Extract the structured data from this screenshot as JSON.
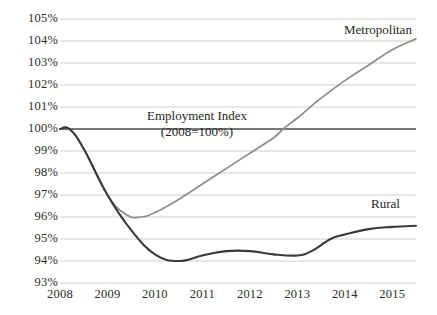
{
  "chart_data": {
    "type": "line",
    "title": "",
    "subtitle": "",
    "xlabel": "",
    "ylabel": "",
    "xlim": [
      2008,
      2015.5
    ],
    "ylim": [
      93,
      105
    ],
    "grid": true,
    "legend_position": "inline-annotations",
    "x_ticks": [
      "2008",
      "2009",
      "2010",
      "2011",
      "2012",
      "2013",
      "2014",
      "2015"
    ],
    "y_ticks": [
      "93%",
      "94%",
      "95%",
      "96%",
      "97%",
      "98%",
      "99%",
      "100%",
      "101%",
      "102%",
      "103%",
      "104%",
      "105%"
    ],
    "annotations": [
      {
        "text": "Employment Index",
        "note": "chart title line 1"
      },
      {
        "text": "(2008=100%)",
        "note": "chart title line 2"
      },
      {
        "text": "Metropolitan",
        "note": "series label for grey line"
      },
      {
        "text": "Rural",
        "note": "series label for dark line"
      }
    ],
    "baseline_value": 100,
    "series": [
      {
        "name": "Metropolitan",
        "color": "#8d8d8d",
        "x": [
          2008,
          2008.2,
          2008.5,
          2009,
          2009.4,
          2009.7,
          2010,
          2010.5,
          2011,
          2011.5,
          2012,
          2012.5,
          2012.7,
          2013,
          2013.5,
          2014,
          2014.5,
          2015,
          2015.5
        ],
        "values": [
          100,
          100,
          99.1,
          97.0,
          96.1,
          96.0,
          96.2,
          96.8,
          97.5,
          98.2,
          98.9,
          99.6,
          100.0,
          100.5,
          101.4,
          102.2,
          102.9,
          103.6,
          104.1
        ]
      },
      {
        "name": "Rural",
        "color": "#3a3a3a",
        "x": [
          2008,
          2008.2,
          2008.5,
          2009,
          2009.5,
          2010,
          2010.5,
          2011,
          2011.5,
          2012,
          2012.5,
          2013,
          2013.3,
          2013.7,
          2014,
          2014.5,
          2015,
          2015.5
        ],
        "values": [
          100,
          100,
          99.1,
          97.0,
          95.4,
          94.3,
          94.0,
          94.25,
          94.45,
          94.45,
          94.3,
          94.25,
          94.45,
          95.0,
          95.2,
          95.45,
          95.55,
          95.6
        ]
      }
    ]
  },
  "style": {
    "gridline_color": "#c9c9c9",
    "baseline_color": "#4a4a4a",
    "text_color": "#2b2b2b",
    "background": "#ffffff"
  }
}
